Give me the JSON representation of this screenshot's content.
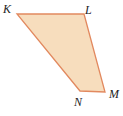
{
  "figure": {
    "name": "quadrilateral-KLMN",
    "type": "polygon",
    "shape_name": "trapezoid",
    "background_color": "#ffffff",
    "fill_color": "#f7ddbd",
    "stroke_color": "#e2895f",
    "stroke_width": 1.3,
    "label_color": "#1d1d1d",
    "vertices": [
      {
        "label": "K",
        "x": 17,
        "y": 14
      },
      {
        "label": "L",
        "x": 84,
        "y": 14
      },
      {
        "label": "M",
        "x": 105,
        "y": 92
      },
      {
        "label": "N",
        "x": 80,
        "y": 91
      }
    ],
    "points_attr": "17,14 84,14 105,92 80,91",
    "labels": {
      "K": "K",
      "L": "L",
      "M": "M",
      "N": "N"
    }
  }
}
